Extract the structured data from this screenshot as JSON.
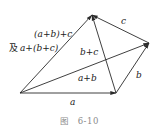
{
  "diagram": {
    "type": "vector-addition-associative-law",
    "points": {
      "O": [
        20,
        93
      ],
      "A": [
        116,
        93
      ],
      "B": [
        149,
        43
      ],
      "C": [
        92,
        15
      ]
    },
    "vectors": [
      {
        "name": "a",
        "from": "O",
        "to": "A",
        "label": "a"
      },
      {
        "name": "b",
        "from": "A",
        "to": "B",
        "label": "b"
      },
      {
        "name": "c",
        "from": "B",
        "to": "C",
        "label": "c"
      },
      {
        "name": "a+b",
        "from": "O",
        "to": "B",
        "label": "a+b"
      },
      {
        "name": "b+c",
        "from": "A",
        "to": "C",
        "label": "b+c"
      },
      {
        "name": "(a+b)+c",
        "from": "O",
        "to": "C",
        "label": "(a+b)+c"
      }
    ],
    "labels": {
      "a": "a",
      "b": "b",
      "c": "c",
      "a_plus_b": "a+b",
      "b_plus_c": "b+c",
      "sum_line1": "(a+b)+c",
      "sum_line2_prefix": "及",
      "sum_line2": "a+(b+c)"
    },
    "line_color": "#2a2a2a"
  },
  "caption": {
    "prefix": "图",
    "number": "6-10"
  }
}
